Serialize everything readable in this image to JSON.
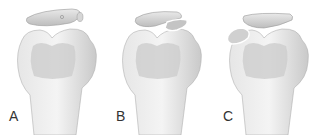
{
  "figure": {
    "panels": [
      {
        "label": "A",
        "variant": "intact-meniscus-with-lateral-fragment-marker"
      },
      {
        "label": "B",
        "variant": "torn-fragment-folded-over-at-lateral-edge"
      },
      {
        "label": "C",
        "variant": "displaced-fragment-at-medial-edge"
      }
    ],
    "colors": {
      "bone_light": "#efefef",
      "bone_mid": "#d4d4d4",
      "bone_shadow": "#b8b8b8",
      "fragment": "#cfcfcf",
      "outline": "#9a9a9a",
      "label": "#333333"
    }
  }
}
